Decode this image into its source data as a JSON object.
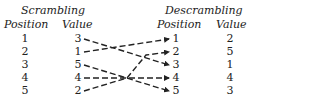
{
  "scrambling": {
    "title": "Scrambling",
    "position_header": "Position",
    "value_header": "Value",
    "rows": [
      {
        "position": "1",
        "value": "3"
      },
      {
        "position": "2",
        "value": "1"
      },
      {
        "position": "3",
        "value": "5"
      },
      {
        "position": "4",
        "value": "4"
      },
      {
        "position": "5",
        "value": "2"
      }
    ]
  },
  "descrambling": {
    "title": "Descrambling",
    "position_header": "Position",
    "value_header": "Value",
    "rows": [
      {
        "position": "1",
        "value": "2"
      },
      {
        "position": "2",
        "value": "5"
      },
      {
        "position": "3",
        "value": "1"
      },
      {
        "position": "4",
        "value": "4"
      },
      {
        "position": "5",
        "value": "3"
      }
    ]
  },
  "arrows": [
    {
      "from_row": 1,
      "to_position": 3
    },
    {
      "from_row": 2,
      "to_position": 1
    },
    {
      "from_row": 3,
      "to_position": 5
    },
    {
      "from_row": 4,
      "to_position": 4
    },
    {
      "from_row": 5,
      "to_position": 2
    }
  ]
}
